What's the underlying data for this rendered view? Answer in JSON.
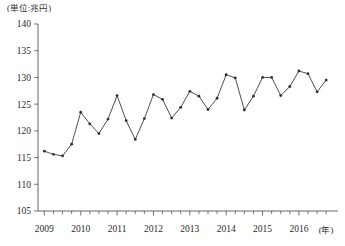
{
  "unit_label": "(単位:兆円)",
  "x_axis_name": "(年)",
  "chart_data": {
    "type": "line",
    "title": "",
    "subtitle": "",
    "xlabel": "(年)",
    "ylabel": "(単位:兆円)",
    "ylim": [
      105,
      140
    ],
    "ytick_labels": [
      "105",
      "110",
      "115",
      "120",
      "125",
      "130",
      "135",
      "140"
    ],
    "ytick_values": [
      105,
      110,
      115,
      120,
      125,
      130,
      135,
      140
    ],
    "xtick_labels": [
      "2009",
      "2010",
      "2011",
      "2012",
      "2013",
      "2014",
      "2015",
      "2016"
    ],
    "xtick_values": [
      2009,
      2010,
      2011,
      2012,
      2013,
      2014,
      2015,
      2016
    ],
    "grid": false,
    "legend": "none",
    "x_minor_ticks_per_year": 4,
    "series": [
      {
        "name": "四半期値",
        "x": [
          "2009Q1",
          "2009Q2",
          "2009Q3",
          "2009Q4",
          "2010Q1",
          "2010Q2",
          "2010Q3",
          "2010Q4",
          "2011Q1",
          "2011Q2",
          "2011Q3",
          "2011Q4",
          "2012Q1",
          "2012Q2",
          "2012Q3",
          "2012Q4",
          "2013Q1",
          "2013Q2",
          "2013Q3",
          "2013Q4",
          "2014Q1",
          "2014Q2",
          "2014Q3",
          "2014Q4",
          "2015Q1",
          "2015Q2",
          "2015Q3",
          "2015Q4",
          "2016Q1",
          "2016Q2",
          "2016Q3",
          "2016Q4"
        ],
        "values": [
          116.2,
          115.6,
          115.3,
          117.5,
          123.5,
          121.3,
          119.5,
          122.2,
          126.6,
          121.9,
          118.4,
          122.3,
          126.8,
          125.9,
          122.4,
          124.4,
          127.4,
          126.5,
          124.0,
          126.1,
          130.5,
          129.9,
          123.9,
          126.5,
          130.0,
          130.0,
          126.6,
          128.3,
          131.2,
          130.7,
          127.3,
          129.5
        ]
      }
    ],
    "final_point_value": 133.8,
    "annotations": []
  }
}
